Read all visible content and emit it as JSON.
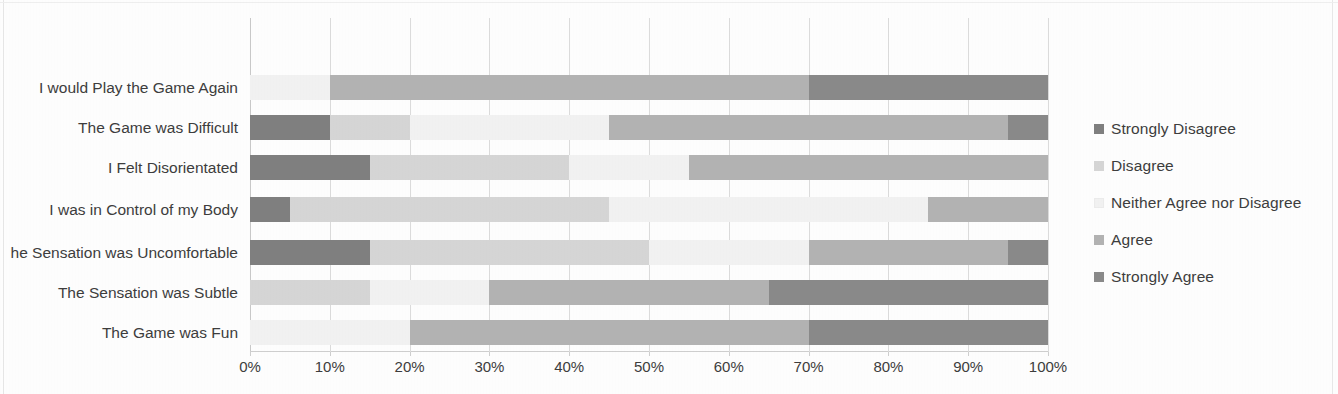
{
  "chart_data": {
    "type": "bar",
    "orientation": "horizontal",
    "stacked": true,
    "normalized": true,
    "title": "",
    "xlabel": "",
    "ylabel": "",
    "xlim": [
      0,
      100
    ],
    "xticks": [
      "0%",
      "10%",
      "20%",
      "30%",
      "40%",
      "50%",
      "60%",
      "70%",
      "80%",
      "90%",
      "100%"
    ],
    "xtick_values": [
      0,
      10,
      20,
      30,
      40,
      50,
      60,
      70,
      80,
      90,
      100
    ],
    "grid": "vertical",
    "legend_position": "right",
    "categories": [
      "I would Play the Game Again",
      "The Game was Difficult",
      "I Felt Disorientated",
      "I was in Control of my Body",
      "he Sensation was Uncomfortable",
      "The Sensation was Subtle",
      "The Game was Fun"
    ],
    "series": [
      {
        "name": "Strongly Disagree",
        "color": "#808080",
        "values": [
          0,
          10,
          15,
          5,
          15,
          0,
          0
        ]
      },
      {
        "name": "Disagree",
        "color": "#d6d6d6",
        "values": [
          0,
          10,
          25,
          40,
          35,
          15,
          0
        ]
      },
      {
        "name": "Neither Agree nor Disagree",
        "color": "#f2f2f2",
        "values": [
          10,
          25,
          15,
          40,
          20,
          15,
          20
        ]
      },
      {
        "name": "Agree",
        "color": "#b3b3b3",
        "values": [
          60,
          50,
          45,
          15,
          25,
          35,
          50
        ]
      },
      {
        "name": "Strongly Agree",
        "color": "#8a8a8a",
        "values": [
          30,
          5,
          0,
          0,
          5,
          35,
          30
        ]
      }
    ]
  },
  "legend": {
    "items": [
      "Strongly Disagree",
      "Disagree",
      "Neither Agree nor Disagree",
      "Agree",
      "Strongly Agree"
    ]
  },
  "colors": {
    "strongly_disagree": "#808080",
    "disagree": "#d6d6d6",
    "neither": "#f2f2f2",
    "agree": "#b3b3b3",
    "strongly_agree": "#8a8a8a",
    "gridline": "#dcdcdc",
    "text": "#3d3d3d"
  }
}
